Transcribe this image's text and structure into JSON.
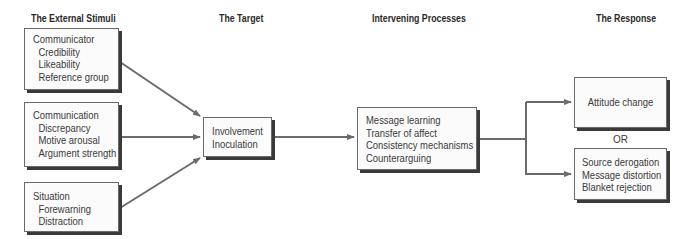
{
  "columns": [
    {
      "id": "external-stimuli",
      "header": "The External Stimuli"
    },
    {
      "id": "target",
      "header": "The Target"
    },
    {
      "id": "intervening-processes",
      "header": "Intervening Processes"
    },
    {
      "id": "response",
      "header": "The Response"
    }
  ],
  "stimuli": [
    {
      "title": "Communicator",
      "items": [
        "Credibility",
        "Likeability",
        "Reference group"
      ]
    },
    {
      "title": "Communication",
      "items": [
        "Discrepancy",
        "Motive arousal",
        "Argument strength"
      ]
    },
    {
      "title": "Situation",
      "items": [
        "Forewarning",
        "Distraction"
      ]
    }
  ],
  "target": {
    "items": [
      "Involvement",
      "Inoculation"
    ]
  },
  "processes": {
    "items": [
      "Message learning",
      "Transfer of affect",
      "Consistency mechanisms",
      "Counterarguing"
    ]
  },
  "response": {
    "positive": {
      "items": [
        "Attitude change"
      ]
    },
    "connector": "OR",
    "negative": {
      "items": [
        "Source derogation",
        "Message distortion",
        "Blanket rejection"
      ]
    }
  },
  "colors": {
    "arrow": "#6b6b6b",
    "border": "#6a6a6a",
    "shadow": "#3a3a3a",
    "text": "#3a3a3a"
  }
}
